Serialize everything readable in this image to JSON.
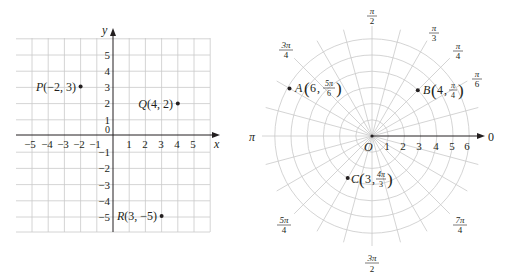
{
  "figure": {
    "cartesian": {
      "x_axis_label": "x",
      "y_axis_label": "y",
      "origin_label": "0",
      "x_ticks": [
        "−5",
        "−4",
        "−3",
        "−2",
        "−1",
        "1",
        "2",
        "3",
        "4",
        "5"
      ],
      "y_ticks": [
        "5",
        "4",
        "3",
        "2",
        "1",
        "−1",
        "−2",
        "−3",
        "−4",
        "−5"
      ],
      "points": [
        {
          "name": "P",
          "coords": "(−2, 3)",
          "x": -2,
          "y": 3
        },
        {
          "name": "Q",
          "coords": "(4, 2)",
          "x": 4,
          "y": 2
        },
        {
          "name": "R",
          "coords": "(3, −5)",
          "x": 3,
          "y": -5
        }
      ]
    },
    "polar": {
      "pole_label": "O",
      "polar_axis_label": "0",
      "radius_ticks": [
        "1",
        "2",
        "3",
        "4",
        "5",
        "6"
      ],
      "angle_labels": {
        "pi_over_2": {
          "num": "π",
          "den": "2"
        },
        "pi_over_3": {
          "num": "π",
          "den": "3"
        },
        "pi_over_4": {
          "num": "π",
          "den": "4"
        },
        "pi_over_6": {
          "num": "π",
          "den": "6"
        },
        "three_pi_over_4": {
          "num": "3π",
          "den": "4"
        },
        "pi": "π",
        "five_pi_over_4": {
          "num": "5π",
          "den": "4"
        },
        "three_pi_over_2": {
          "num": "3π",
          "den": "2"
        },
        "seven_pi_over_4": {
          "num": "7π",
          "den": "4"
        }
      },
      "points": [
        {
          "name": "A",
          "r": "6",
          "theta_num": "5π",
          "theta_den": "6"
        },
        {
          "name": "B",
          "r": "4",
          "theta_num": "π",
          "theta_den": "4"
        },
        {
          "name": "C",
          "r": "3",
          "theta_num": "4π",
          "theta_den": "3"
        }
      ]
    }
  }
}
